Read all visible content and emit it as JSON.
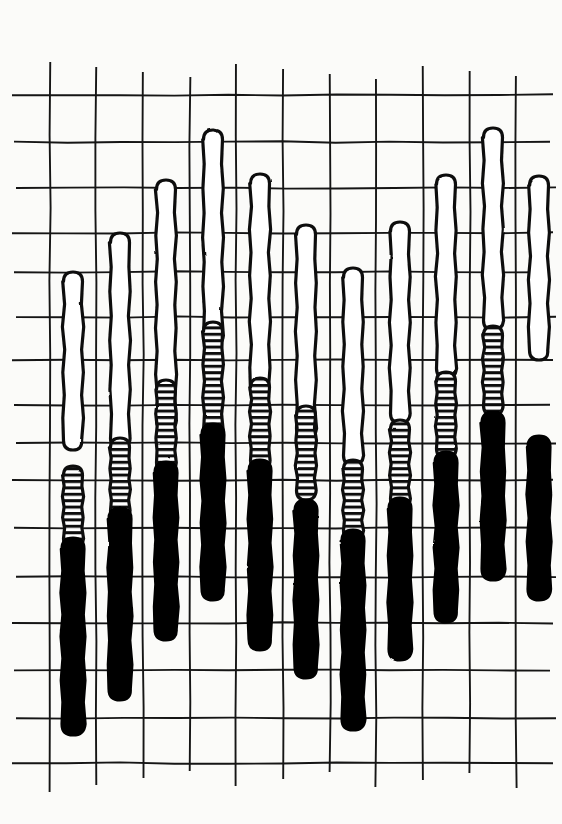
{
  "page": {
    "title": "Flame design",
    "background_color": "#ffffff",
    "ink_color": "#111111"
  },
  "grid": {
    "name": "canvas-grid",
    "vertical_lines_x": [
      50,
      96,
      143,
      190,
      236,
      283,
      330,
      376,
      423,
      470,
      516
    ],
    "horizontal_lines_y": [
      95,
      142,
      188,
      233,
      272,
      317,
      360,
      405,
      443,
      480,
      528,
      577,
      623,
      670,
      718,
      763
    ],
    "vertical_extent": [
      62,
      792
    ],
    "horizontal_extent": [
      12,
      556
    ],
    "stroke_width": 1.9,
    "color": "#151515"
  },
  "legend": {
    "fills": [
      {
        "key": "outline",
        "label": "white / outline only",
        "color": "#ffffff"
      },
      {
        "key": "hatch",
        "label": "horizontal hatch",
        "color": "#ffffff"
      },
      {
        "key": "solid",
        "label": "solid black",
        "color": "#000000"
      }
    ]
  },
  "chart_data": {
    "type": "bar",
    "title": "Flame design",
    "xlabel": "",
    "ylabel": "",
    "grid": true,
    "legend_position": "none",
    "note": "Needlepoint / bargello flame pattern: vertical lozenge strokes of three shades arranged in a rising-and-falling wave across 11 columns.",
    "columns": [
      "1",
      "2",
      "3",
      "4",
      "5",
      "6",
      "7",
      "8",
      "9",
      "10",
      "11"
    ],
    "shades": [
      "outline",
      "hatch",
      "solid"
    ],
    "flames": [
      {
        "col": 1,
        "cx": 73,
        "w": 19,
        "top": 272,
        "bottom": 450,
        "fill": "outline"
      },
      {
        "col": 2,
        "cx": 120,
        "w": 19,
        "top": 233,
        "bottom": 448,
        "fill": "outline"
      },
      {
        "col": 3,
        "cx": 166,
        "w": 19,
        "top": 180,
        "bottom": 430,
        "fill": "outline"
      },
      {
        "col": 4,
        "cx": 213,
        "w": 19,
        "top": 130,
        "bottom": 345,
        "fill": "outline"
      },
      {
        "col": 5,
        "cx": 260,
        "w": 19,
        "top": 174,
        "bottom": 400,
        "fill": "outline"
      },
      {
        "col": 6,
        "cx": 306,
        "w": 19,
        "top": 225,
        "bottom": 438,
        "fill": "outline"
      },
      {
        "col": 7,
        "cx": 353,
        "w": 19,
        "top": 268,
        "bottom": 465,
        "fill": "outline"
      },
      {
        "col": 8,
        "cx": 400,
        "w": 19,
        "top": 222,
        "bottom": 423,
        "fill": "outline"
      },
      {
        "col": 9,
        "cx": 446,
        "w": 19,
        "top": 175,
        "bottom": 378,
        "fill": "outline"
      },
      {
        "col": 10,
        "cx": 493,
        "w": 19,
        "top": 128,
        "bottom": 330,
        "fill": "outline"
      },
      {
        "col": 11,
        "cx": 539,
        "w": 19,
        "top": 176,
        "bottom": 360,
        "fill": "outline"
      },
      {
        "col": 1,
        "cx": 73,
        "w": 19,
        "top": 466,
        "bottom": 548,
        "fill": "hatch"
      },
      {
        "col": 2,
        "cx": 120,
        "w": 19,
        "top": 438,
        "bottom": 520,
        "fill": "hatch"
      },
      {
        "col": 3,
        "cx": 166,
        "w": 19,
        "top": 380,
        "bottom": 472,
        "fill": "hatch"
      },
      {
        "col": 4,
        "cx": 213,
        "w": 19,
        "top": 322,
        "bottom": 440,
        "fill": "hatch"
      },
      {
        "col": 5,
        "cx": 260,
        "w": 19,
        "top": 378,
        "bottom": 470,
        "fill": "hatch"
      },
      {
        "col": 6,
        "cx": 306,
        "w": 19,
        "top": 406,
        "bottom": 500,
        "fill": "hatch"
      },
      {
        "col": 7,
        "cx": 353,
        "w": 19,
        "top": 460,
        "bottom": 540,
        "fill": "hatch"
      },
      {
        "col": 8,
        "cx": 400,
        "w": 19,
        "top": 420,
        "bottom": 508,
        "fill": "hatch"
      },
      {
        "col": 9,
        "cx": 446,
        "w": 19,
        "top": 372,
        "bottom": 458,
        "fill": "hatch"
      },
      {
        "col": 10,
        "cx": 493,
        "w": 19,
        "top": 326,
        "bottom": 415,
        "fill": "hatch"
      },
      {
        "col": 1,
        "cx": 73,
        "w": 22,
        "top": 538,
        "bottom": 735,
        "fill": "solid"
      },
      {
        "col": 2,
        "cx": 120,
        "w": 22,
        "top": 508,
        "bottom": 700,
        "fill": "solid"
      },
      {
        "col": 3,
        "cx": 166,
        "w": 22,
        "top": 462,
        "bottom": 640,
        "fill": "solid"
      },
      {
        "col": 4,
        "cx": 213,
        "w": 22,
        "top": 424,
        "bottom": 600,
        "fill": "solid"
      },
      {
        "col": 5,
        "cx": 260,
        "w": 22,
        "top": 460,
        "bottom": 650,
        "fill": "solid"
      },
      {
        "col": 6,
        "cx": 306,
        "w": 22,
        "top": 500,
        "bottom": 678,
        "fill": "solid"
      },
      {
        "col": 7,
        "cx": 353,
        "w": 22,
        "top": 530,
        "bottom": 730,
        "fill": "solid"
      },
      {
        "col": 8,
        "cx": 400,
        "w": 22,
        "top": 498,
        "bottom": 660,
        "fill": "solid"
      },
      {
        "col": 9,
        "cx": 446,
        "w": 22,
        "top": 452,
        "bottom": 622,
        "fill": "solid"
      },
      {
        "col": 10,
        "cx": 493,
        "w": 22,
        "top": 412,
        "bottom": 580,
        "fill": "solid"
      },
      {
        "col": 11,
        "cx": 539,
        "w": 22,
        "top": 436,
        "bottom": 600,
        "fill": "solid"
      }
    ]
  }
}
